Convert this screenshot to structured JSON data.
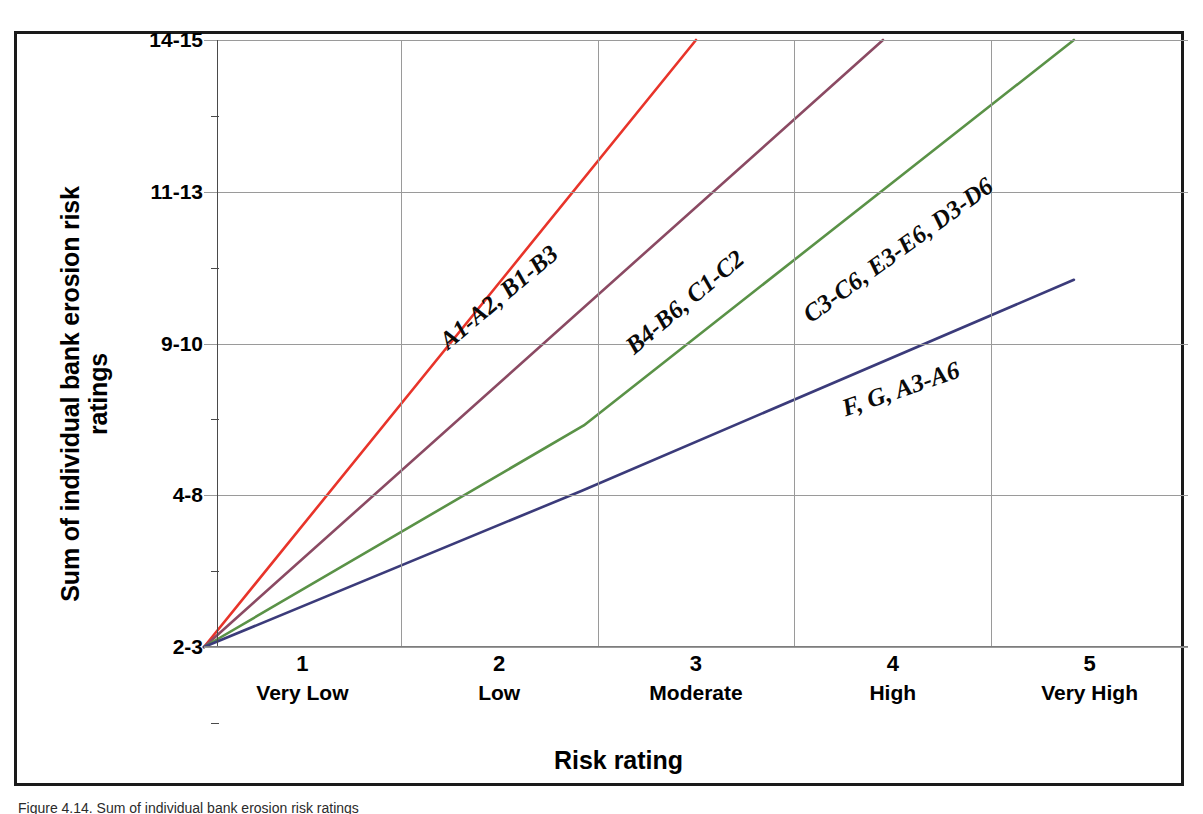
{
  "chart_data": {
    "type": "line",
    "title": "",
    "xlabel": "Risk rating",
    "ylabel": "Sum of individual bank erosion risk ratings",
    "ylabel_line1": "Sum of individual bank erosion risk",
    "ylabel_line2": "ratings",
    "x": [
      1,
      2,
      3,
      4,
      5
    ],
    "xtick_numbers": [
      "1",
      "2",
      "3",
      "4",
      "5"
    ],
    "xtick_words": [
      "Very Low",
      "Low",
      "Moderate",
      "High",
      "Very High"
    ],
    "xlim": [
      0.5,
      5.5
    ],
    "ytick_labels": [
      "2-3",
      "4-8",
      "9-10",
      "11-13",
      "14-15"
    ],
    "ylim": [
      1,
      5
    ],
    "grid": true,
    "legend": "inline-labels",
    "series": [
      {
        "name": "A1-A2, B1-B3",
        "color": "#e8342a",
        "label_angle_deg": -40,
        "points": [
          [
            0.5,
            1
          ],
          [
            3.0,
            5
          ]
        ]
      },
      {
        "name": "B4-B6, C1-C2",
        "color": "#8b4a63",
        "label_angle_deg": -40,
        "points": [
          [
            0.5,
            1
          ],
          [
            3.95,
            5
          ]
        ]
      },
      {
        "name": "C3-C6, E3-E6, D3-D6",
        "color": "#5a9247",
        "label_angle_deg": -36,
        "points": [
          [
            0.5,
            1
          ],
          [
            2.43,
            2.46
          ],
          [
            4.92,
            5
          ]
        ]
      },
      {
        "name": "F, G, A3-A6",
        "color": "#3b3b7a",
        "label_angle_deg": -19,
        "points": [
          [
            0.5,
            1
          ],
          [
            2.42,
            2.03
          ],
          [
            4.92,
            3.42
          ]
        ]
      }
    ]
  },
  "figure": {
    "caption": "Figure 4.14. Sum of individual bank erosion risk ratings"
  },
  "colors": {
    "frame": "#1a1a1a",
    "grid": "#9a9a9a",
    "axis": "#4a4a4a",
    "text": "#000000"
  }
}
